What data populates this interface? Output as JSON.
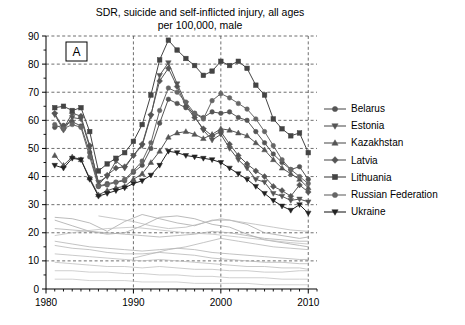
{
  "title": {
    "line1": "SDR, suicide and self-inflicted injury, all ages",
    "line2": "per 100,000, male"
  },
  "panel_label": "A",
  "legend": {
    "items": [
      {
        "label": "Belarus",
        "marker": "circle",
        "color": "#555555"
      },
      {
        "label": "Estonia",
        "marker": "triangle-down",
        "color": "#555555"
      },
      {
        "label": "Kazakhstan",
        "marker": "triangle-up",
        "color": "#555555"
      },
      {
        "label": "Latvia",
        "marker": "diamond",
        "color": "#555555"
      },
      {
        "label": "Lithuania",
        "marker": "square",
        "color": "#444444"
      },
      {
        "label": "Russian Federation",
        "marker": "circle",
        "color": "#666666"
      },
      {
        "label": "Ukraine",
        "marker": "triangle-down",
        "color": "#222222"
      }
    ]
  },
  "chart_data": {
    "type": "line",
    "title": "SDR, suicide and self-inflicted injury, all ages per 100,000, male",
    "xlabel": "",
    "ylabel": "",
    "xlim": [
      1980,
      2011
    ],
    "ylim": [
      0,
      90
    ],
    "ytick_step": 10,
    "yticks": [
      0,
      10,
      20,
      30,
      40,
      50,
      60,
      70,
      80,
      90
    ],
    "xticks": [
      1980,
      1990,
      2000,
      2010
    ],
    "xtick_minor_step": 1,
    "grid": true,
    "grid_style": "dashed",
    "legend_position": "right",
    "series": [
      {
        "name": "Belarus",
        "marker": "circle",
        "color": "#555555",
        "x": [
          1981,
          1982,
          1983,
          1984,
          1985,
          1986,
          1987,
          1988,
          1989,
          1990,
          1991,
          1992,
          1993,
          1994,
          1995,
          1996,
          1997,
          1998,
          1999,
          2000,
          2001,
          2002,
          2003,
          2004,
          2005,
          2006,
          2007,
          2008,
          2009,
          2010
        ],
        "y": [
          57.5,
          58.2,
          59.5,
          58.0,
          48.5,
          36.5,
          37.5,
          38.0,
          38.5,
          41.5,
          44.0,
          50.0,
          59.0,
          67.5,
          66.0,
          64.5,
          62.5,
          61.0,
          63.0,
          62.5,
          63.0,
          61.0,
          60.0,
          56.0,
          52.0,
          48.0,
          45.0,
          42.5,
          43.5,
          39.0
        ]
      },
      {
        "name": "Estonia",
        "marker": "triangle-down",
        "color": "#555555",
        "x": [
          1981,
          1982,
          1983,
          1984,
          1985,
          1986,
          1987,
          1988,
          1989,
          1990,
          1991,
          1992,
          1993,
          1994,
          1995,
          1996,
          1997,
          1998,
          1999,
          2000,
          2001,
          2002,
          2003,
          2004,
          2005,
          2006,
          2007,
          2008,
          2009,
          2010
        ],
        "y": [
          62.0,
          56.5,
          61.0,
          60.5,
          50.5,
          38.0,
          40.0,
          45.5,
          43.0,
          47.5,
          51.0,
          61.5,
          76.0,
          80.5,
          73.0,
          66.0,
          61.5,
          56.5,
          53.0,
          55.0,
          50.0,
          46.0,
          43.0,
          39.0,
          38.0,
          34.0,
          33.0,
          31.5,
          32.0,
          31.0
        ]
      },
      {
        "name": "Kazakhstan",
        "marker": "triangle-up",
        "color": "#555555",
        "x": [
          1981,
          1982,
          1983,
          1984,
          1985,
          1986,
          1987,
          1988,
          1989,
          1990,
          1991,
          1992,
          1993,
          1994,
          1995,
          1996,
          1997,
          1998,
          1999,
          2000,
          2001,
          2002,
          2003,
          2004,
          2005,
          2006,
          2007,
          2008,
          2009,
          2010
        ],
        "y": [
          47.5,
          44.0,
          47.0,
          46.0,
          39.5,
          33.5,
          35.0,
          36.0,
          36.5,
          39.0,
          41.0,
          45.0,
          49.0,
          54.0,
          55.5,
          56.0,
          55.0,
          53.5,
          55.0,
          57.0,
          56.5,
          55.5,
          54.5,
          52.0,
          49.5,
          46.0,
          43.0,
          41.0,
          39.0,
          36.0
        ]
      },
      {
        "name": "Latvia",
        "marker": "diamond",
        "color": "#555555",
        "x": [
          1981,
          1982,
          1983,
          1984,
          1985,
          1986,
          1987,
          1988,
          1989,
          1990,
          1991,
          1992,
          1993,
          1994,
          1995,
          1996,
          1997,
          1998,
          1999,
          2000,
          2001,
          2002,
          2003,
          2004,
          2005,
          2006,
          2007,
          2008,
          2009,
          2010
        ],
        "y": [
          62.5,
          57.0,
          62.5,
          61.5,
          51.0,
          37.0,
          40.5,
          43.0,
          43.5,
          47.5,
          51.5,
          62.0,
          74.0,
          78.5,
          72.0,
          65.0,
          61.0,
          57.0,
          54.5,
          56.0,
          51.5,
          47.5,
          44.5,
          42.0,
          40.0,
          36.5,
          35.0,
          33.0,
          37.0,
          34.5
        ]
      },
      {
        "name": "Lithuania",
        "marker": "square",
        "color": "#444444",
        "x": [
          1981,
          1982,
          1983,
          1984,
          1985,
          1986,
          1987,
          1988,
          1989,
          1990,
          1991,
          1992,
          1993,
          1994,
          1995,
          1996,
          1997,
          1998,
          1999,
          2000,
          2001,
          2002,
          2003,
          2004,
          2005,
          2006,
          2007,
          2008,
          2009,
          2010
        ],
        "y": [
          64.5,
          65.0,
          63.5,
          64.5,
          56.0,
          42.0,
          44.5,
          46.5,
          48.5,
          52.5,
          58.5,
          69.0,
          81.5,
          88.5,
          85.0,
          82.0,
          79.5,
          76.0,
          77.5,
          81.0,
          79.5,
          81.0,
          78.5,
          72.5,
          69.0,
          60.5,
          57.0,
          54.5,
          55.5,
          48.5
        ]
      },
      {
        "name": "Russian Federation",
        "marker": "circle",
        "color": "#666666",
        "x": [
          1981,
          1982,
          1983,
          1984,
          1985,
          1986,
          1987,
          1988,
          1989,
          1990,
          1991,
          1992,
          1993,
          1994,
          1995,
          1996,
          1997,
          1998,
          1999,
          2000,
          2001,
          2002,
          2003,
          2004,
          2005,
          2006,
          2007,
          2008,
          2009,
          2010
        ],
        "y": [
          58.5,
          57.0,
          58.5,
          57.5,
          47.0,
          36.5,
          37.0,
          38.0,
          39.0,
          42.0,
          45.5,
          52.0,
          63.5,
          71.5,
          70.0,
          66.5,
          62.5,
          60.5,
          67.0,
          69.5,
          68.0,
          66.0,
          64.0,
          60.5,
          56.0,
          51.0,
          46.0,
          42.5,
          40.0,
          37.5
        ]
      },
      {
        "name": "Ukraine",
        "marker": "triangle-down",
        "color": "#222222",
        "x": [
          1981,
          1982,
          1983,
          1984,
          1985,
          1986,
          1987,
          1988,
          1989,
          1990,
          1991,
          1992,
          1993,
          1994,
          1995,
          1996,
          1997,
          1998,
          1999,
          2000,
          2001,
          2002,
          2003,
          2004,
          2005,
          2006,
          2007,
          2008,
          2009,
          2010
        ],
        "y": [
          44.0,
          43.0,
          46.5,
          46.0,
          39.0,
          33.0,
          34.0,
          35.0,
          36.0,
          37.5,
          38.5,
          40.5,
          44.0,
          49.0,
          48.5,
          47.5,
          47.0,
          46.5,
          46.0,
          45.0,
          43.0,
          41.0,
          39.0,
          36.5,
          34.0,
          31.5,
          29.5,
          28.0,
          30.0,
          27.0
        ]
      }
    ],
    "background_series": [
      {
        "name": "reference-line-1",
        "color": "#aaaaaa",
        "x": [
          1981,
          1983,
          1985,
          1987,
          1989,
          1991,
          1993,
          1995,
          1997,
          1999,
          2001,
          2003,
          2005,
          2007,
          2009,
          2010
        ],
        "y": [
          25.5,
          25.0,
          23.5,
          20.5,
          24.0,
          26.5,
          25.0,
          23.5,
          22.5,
          24.5,
          24.5,
          23.0,
          20.0,
          19.0,
          18.0,
          18.5
        ]
      },
      {
        "name": "reference-line-2",
        "color": "#a8a8a8",
        "x": [
          1981,
          1983,
          1985,
          1987,
          1989,
          1991,
          1993,
          1995,
          1997,
          1999,
          2001,
          2003,
          2005,
          2007,
          2009,
          2010
        ],
        "y": [
          24.5,
          22.5,
          20.5,
          19.5,
          20.0,
          22.5,
          25.5,
          26.0,
          25.0,
          23.0,
          22.0,
          19.5,
          17.5,
          16.5,
          15.5,
          15.0
        ]
      },
      {
        "name": "reference-line-3",
        "color": "#b0b0b0",
        "x": [
          1981,
          1983,
          1985,
          1987,
          1989,
          1991,
          1993,
          1995,
          1997,
          1999,
          2001,
          2003,
          2005,
          2007,
          2009,
          2010
        ],
        "y": [
          21.5,
          21.0,
          20.5,
          20.0,
          19.5,
          19.0,
          18.5,
          19.0,
          19.5,
          20.5,
          20.0,
          19.0,
          18.0,
          17.5,
          17.0,
          17.0
        ]
      },
      {
        "name": "reference-line-4",
        "color": "#b4b4b4",
        "x": [
          1981,
          1983,
          1985,
          1987,
          1989,
          1991,
          1993,
          1995,
          1997,
          1999,
          2001,
          2003,
          2005,
          2007,
          2009,
          2010
        ],
        "y": [
          17.0,
          16.0,
          15.0,
          14.5,
          14.0,
          13.5,
          14.0,
          14.5,
          14.0,
          13.0,
          12.5,
          12.0,
          11.5,
          11.0,
          10.5,
          10.5
        ]
      },
      {
        "name": "reference-line-5",
        "color": "#b8b8b8",
        "x": [
          1981,
          1983,
          1985,
          1987,
          1989,
          1991,
          1993,
          1995,
          1997,
          1999,
          2001,
          2003,
          2005,
          2007,
          2009,
          2010
        ],
        "y": [
          15.5,
          14.5,
          14.0,
          13.0,
          12.5,
          12.5,
          13.0,
          12.5,
          12.0,
          11.0,
          10.5,
          10.0,
          9.5,
          9.5,
          9.0,
          9.0
        ]
      },
      {
        "name": "reference-line-6",
        "color": "#bcbcbc",
        "x": [
          1981,
          1983,
          1985,
          1987,
          1989,
          1991,
          1993,
          1995,
          1997,
          1999,
          2001,
          2003,
          2005,
          2007,
          2009,
          2010
        ],
        "y": [
          12.5,
          12.0,
          11.5,
          11.0,
          10.5,
          10.0,
          10.5,
          10.0,
          9.5,
          9.0,
          8.5,
          8.0,
          8.0,
          7.5,
          7.5,
          7.0
        ]
      },
      {
        "name": "reference-line-7",
        "color": "#c0c0c0",
        "x": [
          1981,
          1983,
          1985,
          1987,
          1989,
          1991,
          1993,
          1995,
          1997,
          1999,
          2001,
          2003,
          2005,
          2007,
          2009,
          2010
        ],
        "y": [
          9.5,
          9.0,
          8.5,
          8.0,
          8.0,
          7.5,
          8.0,
          7.5,
          7.0,
          7.0,
          6.5,
          6.5,
          6.0,
          6.0,
          6.5,
          6.5
        ]
      },
      {
        "name": "reference-line-8",
        "color": "#c4c4c4",
        "x": [
          1981,
          1983,
          1985,
          1987,
          1989,
          1991,
          1993,
          1995,
          1997,
          1999,
          2001,
          2003,
          2005,
          2007,
          2009,
          2010
        ],
        "y": [
          6.5,
          6.5,
          6.0,
          6.0,
          5.5,
          5.5,
          5.0,
          5.0,
          4.5,
          4.5,
          4.0,
          4.0,
          4.0,
          3.5,
          3.5,
          3.5
        ]
      },
      {
        "name": "reference-line-9",
        "color": "#c8c8c8",
        "x": [
          1981,
          1983,
          1985,
          1987,
          1989,
          1991,
          1993,
          1995,
          1997,
          1999,
          2001,
          2003,
          2005,
          2007,
          2009,
          2010
        ],
        "y": [
          3.5,
          3.5,
          3.0,
          3.0,
          3.0,
          2.5,
          2.5,
          2.5,
          2.0,
          2.0,
          2.0,
          2.0,
          1.5,
          1.5,
          1.5,
          1.5
        ]
      },
      {
        "name": "reference-line-10",
        "color": "#bababa",
        "x": [
          1986,
          1988,
          1990,
          1992,
          1994,
          1996,
          1998,
          2000,
          2002,
          2004,
          2006,
          2008,
          2010
        ],
        "y": [
          26.0,
          25.0,
          24.0,
          22.5,
          21.5,
          22.0,
          23.5,
          25.0,
          24.0,
          23.0,
          22.0,
          21.0,
          20.5
        ]
      },
      {
        "name": "reference-line-11",
        "color": "#b6b6b6",
        "x": [
          1990,
          1992,
          1994,
          1996,
          1998,
          2000,
          2002,
          2004,
          2006,
          2008,
          2010
        ],
        "y": [
          11.0,
          12.5,
          14.0,
          15.0,
          16.5,
          18.0,
          17.0,
          16.0,
          15.0,
          14.5,
          14.0
        ]
      },
      {
        "name": "reference-line-12",
        "color": "#c0c0c0",
        "x": [
          1981,
          1984,
          1987,
          1990,
          1993,
          1996,
          1999,
          2002,
          2005,
          2008,
          2010
        ],
        "y": [
          19.0,
          20.5,
          21.5,
          22.0,
          21.0,
          20.0,
          19.5,
          18.5,
          17.5,
          16.5,
          16.0
        ]
      }
    ]
  }
}
